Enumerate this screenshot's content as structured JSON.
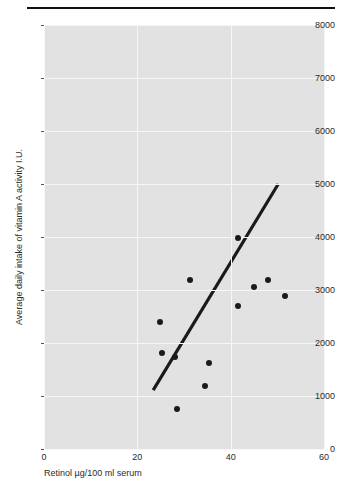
{
  "chart_data": {
    "type": "scatter",
    "title": "",
    "xlabel": "Retinol µg/100 ml serum",
    "ylabel": "Average daily intake of vitamin A activity I.U.",
    "xlim": [
      0,
      60
    ],
    "ylim": [
      0,
      8000
    ],
    "xticks": [
      0,
      20,
      40,
      60
    ],
    "xtick_labels": [
      "0",
      "20",
      "40",
      "60"
    ],
    "yticks": [
      0,
      1000,
      2000,
      3000,
      4000,
      5000,
      6000,
      7000,
      8000
    ],
    "ytick_labels": [
      "0",
      "1000",
      "2000",
      "3000",
      "4000",
      "5000",
      "6000",
      "7000",
      "8000"
    ],
    "grid": true,
    "legend": "none",
    "panel_color": "#e2e2e2",
    "grid_color": "#f7f7f7",
    "point_color": "#1a1a1a",
    "line_color": "#1a1a1a",
    "points": [
      {
        "x": 24.8,
        "y": 2390
      },
      {
        "x": 25.2,
        "y": 1820
      },
      {
        "x": 28.0,
        "y": 1740
      },
      {
        "x": 28.6,
        "y": 760
      },
      {
        "x": 31.3,
        "y": 3180
      },
      {
        "x": 35.4,
        "y": 1620
      },
      {
        "x": 34.6,
        "y": 1190
      },
      {
        "x": 41.6,
        "y": 3980
      },
      {
        "x": 41.6,
        "y": 2700
      },
      {
        "x": 45.0,
        "y": 3050
      },
      {
        "x": 47.9,
        "y": 3180
      },
      {
        "x": 51.6,
        "y": 2890
      }
    ],
    "fit_line": {
      "x0": 23.4,
      "y0": 1110,
      "x1": 50.2,
      "y1": 5000,
      "label": "regression-line"
    }
  },
  "header": {
    "rule": "horizontal-rule"
  }
}
